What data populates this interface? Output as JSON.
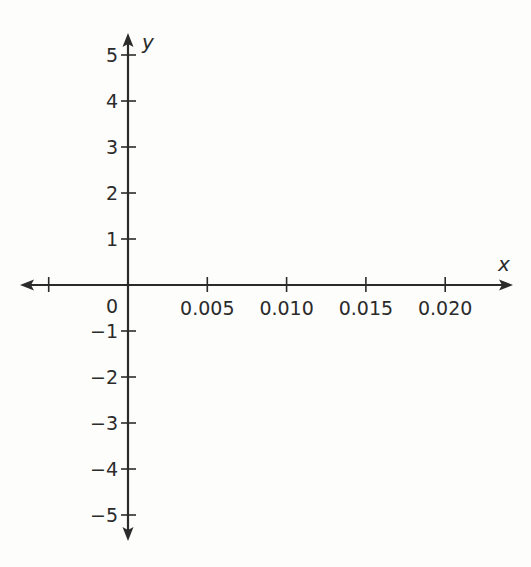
{
  "chart_data": {
    "type": "coordinate-plane",
    "title": "",
    "xlabel": "x",
    "ylabel": "y",
    "origin_label": "0",
    "x_ticks": [
      0.005,
      0.01,
      0.015,
      0.02
    ],
    "x_tick_labels": [
      "0.005",
      "0.010",
      "0.015",
      "0.020"
    ],
    "x_negative_ticks": [
      -0.005
    ],
    "x_negative_tick_labels": [
      ""
    ],
    "y_ticks": [
      5,
      4,
      3,
      2,
      1,
      -1,
      -2,
      -3,
      -4,
      -5
    ],
    "y_tick_labels": [
      "5",
      "4",
      "3",
      "2",
      "1",
      "−1",
      "−2",
      "−3",
      "−4",
      "−5"
    ],
    "xlim": [
      -0.006,
      0.024
    ],
    "ylim": [
      -5.5,
      5.5
    ],
    "grid": false,
    "series": [],
    "arrows": {
      "x_axis": "both-ends",
      "y_axis": "both-ends"
    }
  },
  "colors": {
    "axis": "#2b2b2b",
    "background": "#fdfdfc"
  }
}
